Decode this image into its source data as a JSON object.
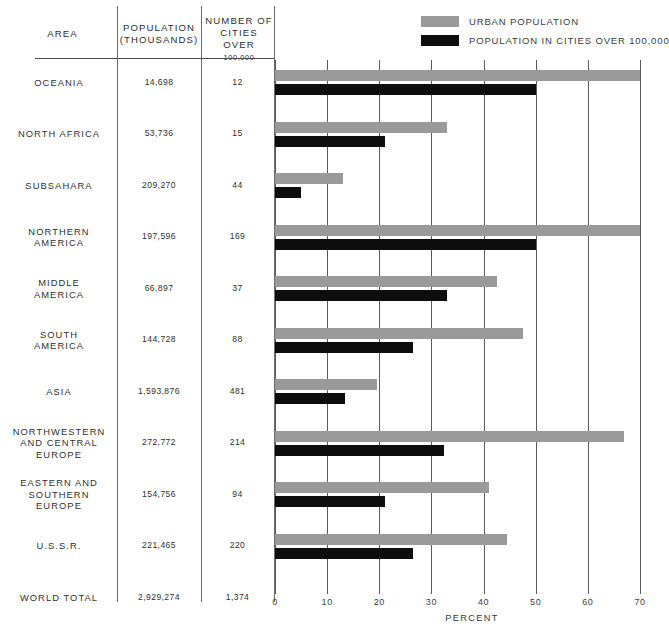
{
  "legend": {
    "items": [
      {
        "key": "urban",
        "label": "URBAN POPULATION",
        "color": "#9a9a9a"
      },
      {
        "key": "cities",
        "label": "POPULATION IN CITIES OVER 100,000",
        "color": "#0d0d0d"
      }
    ]
  },
  "table": {
    "headers": {
      "area": "AREA",
      "population": "POPULATION (THOUSANDS)",
      "population_line1": "POPULATION",
      "population_line2": "(THOUSANDS)",
      "cities_line1": "NUMBER OF",
      "cities_line2": "CITIES OVER",
      "cities_line3": "100,000"
    },
    "rows": [
      {
        "area": "OCEANIA",
        "area_lines": [
          "OCEANIA"
        ],
        "population": "14,698",
        "cities": "12"
      },
      {
        "area": "NORTH AFRICA",
        "area_lines": [
          "NORTH AFRICA"
        ],
        "population": "53,736",
        "cities": "15"
      },
      {
        "area": "SUBSAHARA",
        "area_lines": [
          "SUBSAHARA"
        ],
        "population": "209,270",
        "cities": "44"
      },
      {
        "area": "NORTHERN AMERICA",
        "area_lines": [
          "NORTHERN",
          "AMERICA"
        ],
        "population": "197,596",
        "cities": "169"
      },
      {
        "area": "MIDDLE AMERICA",
        "area_lines": [
          "MIDDLE",
          "AMERICA"
        ],
        "population": "66,897",
        "cities": "37"
      },
      {
        "area": "SOUTH AMERICA",
        "area_lines": [
          "SOUTH",
          "AMERICA"
        ],
        "population": "144,728",
        "cities": "88"
      },
      {
        "area": "ASIA",
        "area_lines": [
          "ASIA"
        ],
        "population": "1,593,876",
        "cities": "481"
      },
      {
        "area": "NORTHWESTERN AND CENTRAL EUROPE",
        "area_lines": [
          "NORTHWESTERN",
          "AND CENTRAL",
          "EUROPE"
        ],
        "population": "272,772",
        "cities": "214"
      },
      {
        "area": "EASTERN AND SOUTHERN EUROPE",
        "area_lines": [
          "EASTERN AND",
          "SOUTHERN",
          "EUROPE"
        ],
        "population": "154,756",
        "cities": "94"
      },
      {
        "area": "U.S.S.R.",
        "area_lines": [
          "U.S.S.R."
        ],
        "population": "221,465",
        "cities": "220"
      },
      {
        "area": "WORLD TOTAL",
        "area_lines": [
          "WORLD TOTAL"
        ],
        "population": "2,929,274",
        "cities": "1,374"
      }
    ]
  },
  "chart_data": {
    "type": "bar",
    "orientation": "horizontal",
    "title": "",
    "xlabel": "PERCENT",
    "ylabel": "",
    "xlim": [
      0,
      70
    ],
    "xticks": [
      0,
      10,
      20,
      30,
      40,
      50,
      60,
      70
    ],
    "grid": true,
    "grid_axis": "x",
    "legend_position": "top-right",
    "categories": [
      "OCEANIA",
      "NORTH AFRICA",
      "SUBSAHARA",
      "NORTHERN AMERICA",
      "MIDDLE AMERICA",
      "SOUTH AMERICA",
      "ASIA",
      "NORTHWESTERN AND CENTRAL EUROPE",
      "EASTERN AND SOUTHERN EUROPE",
      "U.S.S.R."
    ],
    "series": [
      {
        "name": "URBAN POPULATION",
        "color": "#9a9a9a",
        "values": [
          70.0,
          33.0,
          13.0,
          70.0,
          42.5,
          47.5,
          19.5,
          67.0,
          41.0,
          44.5
        ]
      },
      {
        "name": "POPULATION IN CITIES OVER 100,000",
        "color": "#0d0d0d",
        "values": [
          50.0,
          21.0,
          5.0,
          50.0,
          33.0,
          26.5,
          13.5,
          32.5,
          21.0,
          26.5
        ]
      }
    ]
  },
  "axis": {
    "unit_label": "PERCENT"
  }
}
